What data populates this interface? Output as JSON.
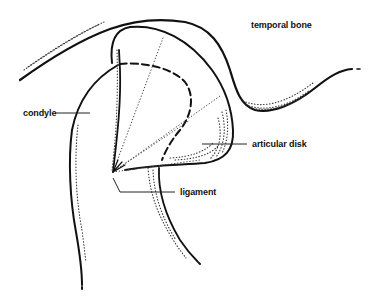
{
  "diagram": {
    "labels": {
      "temporal_bone": "temporal bone",
      "condyle": "condyle",
      "articular_disk": "articular disk",
      "ligament": "ligament"
    },
    "colors": {
      "ink": "#111111",
      "background": "#ffffff"
    }
  }
}
